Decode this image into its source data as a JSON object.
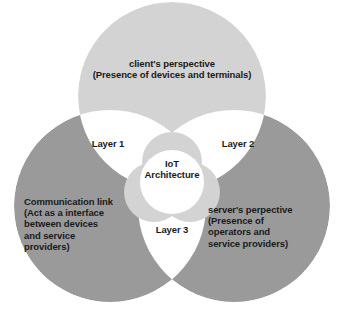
{
  "diagram": {
    "type": "venn-3-circle",
    "title": "IoT Architecture",
    "background_color": "#ffffff",
    "text_color": "#1a1a1a",
    "colors": {
      "top_circle": "#d3d3d3",
      "left_circle": "#9a9a9a",
      "right_circle": "#9a9a9a",
      "intersection": "#ffffff",
      "rosette_ring": "#d3d3d3",
      "center_disc": "#ffffff"
    },
    "center": {
      "lines": [
        "IoT",
        "Architecture"
      ]
    },
    "circles": [
      {
        "id": "client",
        "position": "top",
        "fill": "#d3d3d3",
        "lines": [
          "client's perspective",
          "(Presence of devices and terminals)"
        ]
      },
      {
        "id": "communication",
        "position": "bottom-left",
        "fill": "#9a9a9a",
        "lines": [
          "Communication link",
          "(Act as a interface",
          "between devices",
          "and service",
          "providers)"
        ]
      },
      {
        "id": "server",
        "position": "bottom-right",
        "fill": "#9a9a9a",
        "lines": [
          "server's perpective",
          "(Presence of",
          "operators and",
          "service providers)"
        ]
      }
    ],
    "intersections": [
      {
        "id": "layer-1",
        "label": "Layer 1",
        "between": [
          "client",
          "communication"
        ]
      },
      {
        "id": "layer-2",
        "label": "Layer 2",
        "between": [
          "client",
          "server"
        ]
      },
      {
        "id": "layer-3",
        "label": "Layer 3",
        "between": [
          "communication",
          "server"
        ]
      }
    ]
  }
}
